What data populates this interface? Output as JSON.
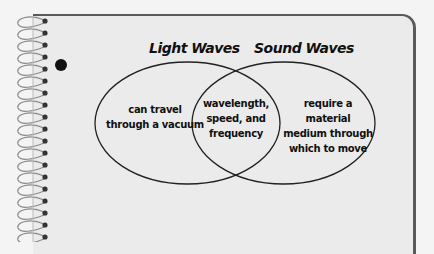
{
  "diagram": {
    "type": "venn",
    "sets": [
      {
        "title": "Light Waves",
        "unique": "can travel through a vacuum",
        "lines": [
          "can travel",
          "through a vacuum"
        ]
      },
      {
        "title": "Sound Waves",
        "unique": "require a material medium through which to move",
        "lines": [
          "require a material",
          "medium through",
          "which to move"
        ]
      }
    ],
    "intersection": {
      "text": "wavelength, speed, and frequency",
      "lines": [
        "wavelength,",
        "speed, and",
        "frequency"
      ]
    }
  },
  "colors": {
    "paper": "#ebebeb",
    "border": "#5a5a5a",
    "ink": "#111111"
  }
}
